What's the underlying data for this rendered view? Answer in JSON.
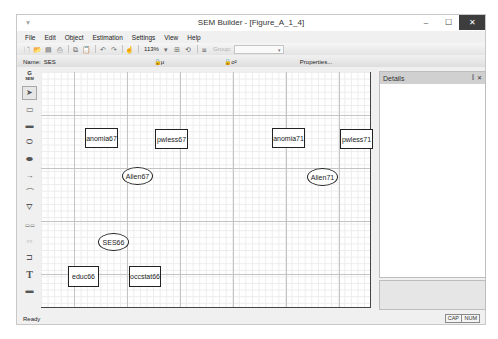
{
  "window": {
    "title": "SEM Builder - [Figure_A_1_4]",
    "app_icon": "sem-app-icon",
    "controls": {
      "minimize": "–",
      "maximize": "☐",
      "close": "✕"
    }
  },
  "menu": [
    "File",
    "Edit",
    "Object",
    "Estimation",
    "Settings",
    "View",
    "Help"
  ],
  "toolbar": {
    "icons": [
      "new-icon",
      "open-icon",
      "save-icon",
      "print-icon",
      "copy-icon",
      "paste-icon",
      "undo-icon",
      "redo-icon",
      "pointer-icon"
    ],
    "zoom_level": "113%",
    "group_label": "Group:",
    "group_value": ""
  },
  "propbar": {
    "name_label": "Name:",
    "name_value": "SES",
    "mu_label": "μ",
    "sigma_label": "σ²",
    "properties_label": "Properties..."
  },
  "tools": [
    {
      "name": "gsem-toggle",
      "label_top": "G",
      "label_bottom": "SEM"
    },
    {
      "name": "select-tool",
      "glyph": "➤"
    },
    {
      "name": "observed-variable-tool",
      "glyph": "▭"
    },
    {
      "name": "generalized-response-tool",
      "glyph": "▬"
    },
    {
      "name": "latent-variable-tool",
      "glyph": "⬭"
    },
    {
      "name": "multilevel-latent-tool",
      "glyph": "⬬"
    },
    {
      "name": "path-tool",
      "glyph": "→"
    },
    {
      "name": "covariance-tool",
      "glyph": "⌒"
    },
    {
      "name": "measurement-component-tool",
      "glyph": "⛛"
    },
    {
      "name": "observed-regression-tool",
      "glyph": "▭▭"
    },
    {
      "name": "latent-regression-tool",
      "glyph": "○○"
    },
    {
      "name": "regression-component-tool",
      "glyph": "⊐"
    },
    {
      "name": "text-tool",
      "glyph": "T"
    },
    {
      "name": "area-tool",
      "glyph": "▬"
    }
  ],
  "canvas": {
    "nodes": [
      {
        "id": "anomia67",
        "label": "anomia67",
        "shape": "rect",
        "x": 44,
        "y": 56,
        "w": 33,
        "h": 20
      },
      {
        "id": "pwless67",
        "label": "pwless67",
        "shape": "rect",
        "x": 114,
        "y": 57,
        "w": 33,
        "h": 20
      },
      {
        "id": "alien67",
        "label": "Alien67",
        "shape": "oval",
        "x": 81,
        "y": 95,
        "w": 31,
        "h": 18
      },
      {
        "id": "anomia71",
        "label": "anomia71",
        "shape": "rect",
        "x": 231,
        "y": 56,
        "w": 33,
        "h": 20
      },
      {
        "id": "pwless71",
        "label": "pwless71",
        "shape": "rect",
        "x": 299,
        "y": 57,
        "w": 33,
        "h": 20
      },
      {
        "id": "alien71",
        "label": "Alien71",
        "shape": "oval",
        "x": 266,
        "y": 96,
        "w": 31,
        "h": 18
      },
      {
        "id": "ses66",
        "label": "SES66",
        "shape": "oval",
        "x": 57,
        "y": 161,
        "w": 31,
        "h": 18
      },
      {
        "id": "educ66",
        "label": "educ66",
        "shape": "rect",
        "x": 27,
        "y": 194,
        "w": 31,
        "h": 21
      },
      {
        "id": "occstat66",
        "label": "occstat66",
        "shape": "rect",
        "x": 88,
        "y": 194,
        "w": 32,
        "h": 21
      }
    ]
  },
  "details": {
    "title": "Details",
    "pin": "⫿",
    "close": "✕"
  },
  "status": {
    "text": "Ready",
    "cap": "CAP",
    "num": "NUM"
  }
}
